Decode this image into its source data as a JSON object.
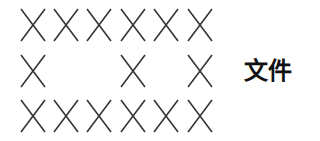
{
  "grid": {
    "glyph": "x-mark",
    "stroke_color": "#333333",
    "rows": [
      {
        "cells": [
          1,
          1,
          1,
          1,
          1,
          1
        ]
      },
      {
        "cells": [
          1,
          0,
          0,
          1,
          0,
          1
        ]
      },
      {
        "cells": [
          1,
          1,
          1,
          1,
          1,
          1
        ]
      }
    ]
  },
  "label": {
    "text": "文件"
  }
}
